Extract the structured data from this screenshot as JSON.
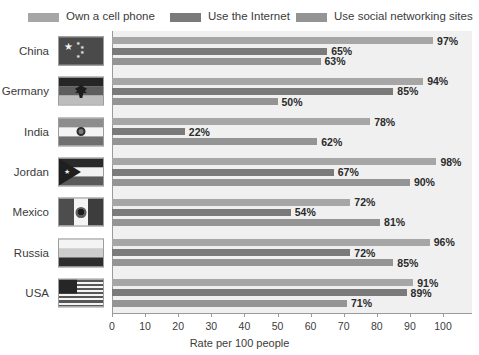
{
  "chart_data": {
    "type": "bar",
    "orientation": "horizontal",
    "title": "",
    "xlabel": "Rate per 100 people",
    "ylabel": "",
    "xlim": [
      0,
      100
    ],
    "xticks": [
      0,
      10,
      20,
      30,
      40,
      50,
      60,
      70,
      80,
      90,
      100
    ],
    "grid": false,
    "legend_position": "top",
    "value_suffix": "%",
    "categories": [
      "China",
      "Germany",
      "India",
      "Jordan",
      "Mexico",
      "Russia",
      "USA"
    ],
    "series": [
      {
        "name": "Own a cell phone",
        "color": "#a6a6a6",
        "values": [
          97,
          94,
          78,
          98,
          72,
          96,
          91
        ],
        "labels": [
          "97%",
          "94%",
          "78%",
          "98%",
          "72%",
          "96%",
          "91%"
        ]
      },
      {
        "name": "Use the Internet",
        "color": "#7a7a7a",
        "values": [
          65,
          85,
          22,
          67,
          54,
          72,
          89
        ],
        "labels": [
          "65%",
          "85%",
          "22%",
          "67%",
          "54%",
          "72%",
          "89%"
        ]
      },
      {
        "name": "Use social networking sites",
        "color": "#949494",
        "values": [
          63,
          50,
          62,
          90,
          81,
          85,
          71
        ],
        "labels": [
          "63%",
          "50%",
          "62%",
          "90%",
          "81%",
          "85%",
          "71%"
        ]
      }
    ],
    "flags": [
      {
        "country": "China",
        "icon": "flag-china-icon"
      },
      {
        "country": "Germany",
        "icon": "flag-germany-icon"
      },
      {
        "country": "India",
        "icon": "flag-india-icon"
      },
      {
        "country": "Jordan",
        "icon": "flag-jordan-icon"
      },
      {
        "country": "Mexico",
        "icon": "flag-mexico-icon"
      },
      {
        "country": "Russia",
        "icon": "flag-russia-icon"
      },
      {
        "country": "USA",
        "icon": "flag-usa-icon"
      }
    ]
  }
}
